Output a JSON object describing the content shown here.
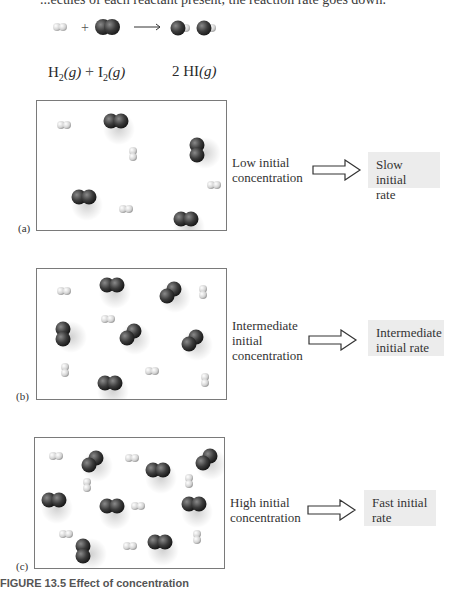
{
  "header_partial_text": "...ecules of each reactant present, the reaction rate goes down.",
  "reaction": {
    "reactant_1": "H",
    "reactant_1_sub": "2",
    "reactant_1_state": "(g)",
    "plus": "+",
    "reactant_2": "I",
    "reactant_2_sub": "2",
    "reactant_2_state": "(g)",
    "product": "2 HI",
    "product_state": "(g)"
  },
  "colors": {
    "iodine": "#3c3c3c",
    "hydrogen": "#d4d4d4",
    "box_border": "#7a7a7a",
    "rate_box_bg": "#ececec"
  },
  "panels": [
    {
      "label": "(a)",
      "concentration_label": [
        "Low initial",
        "concentration"
      ],
      "rate_label": [
        "Slow initial",
        "rate"
      ],
      "molecules": {
        "I2": [
          [
            66,
            12,
            "h"
          ],
          [
            152,
            36,
            "v"
          ],
          [
            34,
            88,
            "h"
          ],
          [
            136,
            110,
            "h"
          ]
        ],
        "H2": [
          [
            20,
            20,
            "h"
          ],
          [
            92,
            46,
            "v"
          ],
          [
            170,
            80,
            "h"
          ],
          [
            82,
            104,
            "h"
          ]
        ]
      }
    },
    {
      "label": "(b)",
      "concentration_label": [
        "Intermediate",
        "initial",
        "concentration"
      ],
      "rate_label": [
        "Intermediate",
        "initial rate"
      ],
      "molecules": {
        "I2": [
          [
            62,
            8,
            "h"
          ],
          [
            122,
            12,
            "d"
          ],
          [
            18,
            52,
            "v"
          ],
          [
            82,
            54,
            "d"
          ],
          [
            144,
            60,
            "d"
          ],
          [
            60,
            106,
            "h"
          ]
        ],
        "H2": [
          [
            20,
            18,
            "h"
          ],
          [
            162,
            16,
            "v"
          ],
          [
            64,
            46,
            "h"
          ],
          [
            24,
            94,
            "v"
          ],
          [
            108,
            98,
            "h"
          ],
          [
            164,
            104,
            "v"
          ]
        ]
      }
    },
    {
      "label": "(c)",
      "concentration_label": [
        "High initial",
        "concentration"
      ],
      "rate_label": [
        "Fast initial",
        "rate"
      ],
      "molecules": {
        "I2": [
          [
            46,
            12,
            "d"
          ],
          [
            110,
            24,
            "h"
          ],
          [
            160,
            10,
            "d"
          ],
          [
            6,
            54,
            "h"
          ],
          [
            64,
            60,
            "h"
          ],
          [
            146,
            58,
            "h"
          ],
          [
            40,
            100,
            "v"
          ],
          [
            112,
            96,
            "h"
          ]
        ],
        "H2": [
          [
            14,
            14,
            "h"
          ],
          [
            90,
            16,
            "h"
          ],
          [
            48,
            40,
            "v"
          ],
          [
            150,
            36,
            "v"
          ],
          [
            96,
            64,
            "h"
          ],
          [
            24,
            92,
            "h"
          ],
          [
            88,
            104,
            "h"
          ],
          [
            158,
            92,
            "v"
          ]
        ]
      }
    }
  ],
  "caption": "FIGURE 13.5 Effect of concentration"
}
